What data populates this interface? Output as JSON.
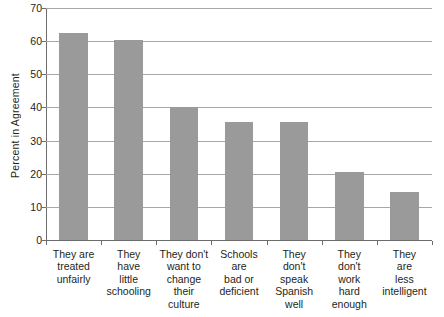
{
  "chart_data": {
    "type": "bar",
    "title": "",
    "subtitle": "",
    "xlabel": "",
    "ylabel": "Percent in Agreement",
    "ylim": [
      0,
      70
    ],
    "yticks": [
      0,
      10,
      20,
      30,
      40,
      50,
      60,
      70
    ],
    "ytick_labels": [
      "0",
      "10",
      "20",
      "30",
      "40",
      "50",
      "60",
      "70"
    ],
    "grid": "horizontal",
    "legend": "none",
    "bar_color": "#9a9a9a",
    "gridline_color": "#a7a7a7",
    "axis_color": "#6d6d6d",
    "background_color": "#ffffff",
    "categories": [
      "They are treated unfairly",
      "They have little schooling",
      "They don't want to change their culture",
      "Schools are bad or deficient",
      "They don't speak Spanish well",
      "They don't work hard enough",
      "They are less intelligent"
    ],
    "category_lines": [
      [
        "They are",
        "treated",
        "unfairly"
      ],
      [
        "They",
        "have",
        "little",
        "schooling"
      ],
      [
        "They don't",
        "want to",
        "change",
        "their",
        "culture"
      ],
      [
        "Schools",
        "are",
        "bad or",
        "deficient"
      ],
      [
        "They",
        "don't",
        "speak",
        "Spanish",
        "well"
      ],
      [
        "They",
        "don't",
        "work",
        "hard",
        "enough"
      ],
      [
        "They",
        "are",
        "less",
        "intelligent"
      ]
    ],
    "values": [
      62.5,
      60.3,
      40,
      35.5,
      35.5,
      20.5,
      14.5
    ]
  }
}
